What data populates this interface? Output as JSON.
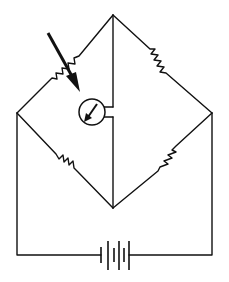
{
  "diagram": {
    "title": "",
    "type": "wheatstone-bridge-circuit",
    "colors": {
      "line": "#111111",
      "background": "#ffffff"
    },
    "nodes": {
      "top": [
        113,
        15
      ],
      "left": [
        17,
        113
      ],
      "right": [
        212,
        113
      ],
      "bottom": [
        113,
        208
      ]
    },
    "components": [
      {
        "id": "R1",
        "kind": "photoresistor",
        "position": "upper-left-arm",
        "light-arrow": true
      },
      {
        "id": "R2",
        "kind": "resistor",
        "position": "upper-right-arm"
      },
      {
        "id": "R3",
        "kind": "resistor",
        "position": "lower-left-arm"
      },
      {
        "id": "R4",
        "kind": "resistor",
        "position": "lower-right-arm"
      },
      {
        "id": "G",
        "kind": "galvanometer",
        "position": "center-bridge"
      },
      {
        "id": "B",
        "kind": "battery",
        "position": "bottom",
        "cells": 2
      }
    ]
  }
}
